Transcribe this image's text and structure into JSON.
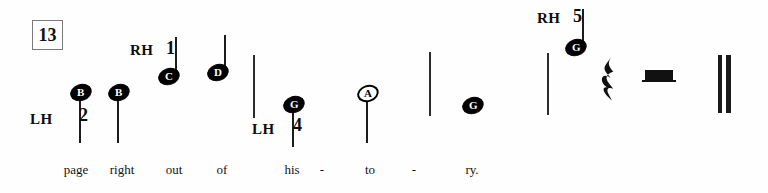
{
  "score": {
    "measure_number": "13",
    "background_color": "#fefefe",
    "ink_color": "#111111"
  },
  "hand_indications": [
    {
      "label": "LH",
      "finger": "2",
      "x": 30,
      "y": 112,
      "finger_x": 79,
      "finger_y": 106
    },
    {
      "label": "RH",
      "finger": "1",
      "x": 130,
      "y": 43,
      "finger_x": 166,
      "finger_y": 39
    },
    {
      "label": "LH",
      "finger": "4",
      "x": 252,
      "y": 122,
      "finger_x": 293,
      "finger_y": 116
    },
    {
      "label": "RH",
      "finger": "5",
      "x": 537,
      "y": 11,
      "finger_x": 573,
      "finger_y": 7
    }
  ],
  "notes": [
    {
      "letter": "B",
      "head": "filled",
      "x": 70,
      "y": 84,
      "stem": true,
      "stem_x": 79,
      "stem_top": 96,
      "stem_bottom": 143
    },
    {
      "letter": "B",
      "head": "filled",
      "x": 108,
      "y": 84,
      "stem": true,
      "stem_x": 117,
      "stem_top": 96,
      "stem_bottom": 143
    },
    {
      "letter": "C",
      "head": "filled",
      "x": 158,
      "y": 68,
      "stem": true,
      "stem_x": 175,
      "stem_top": 37,
      "stem_bottom": 80
    },
    {
      "letter": "D",
      "head": "filled",
      "x": 207,
      "y": 64,
      "stem": true,
      "stem_x": 224,
      "stem_top": 35,
      "stem_bottom": 76
    },
    {
      "letter": "G",
      "head": "filled",
      "x": 283,
      "y": 96,
      "stem": true,
      "stem_x": 292,
      "stem_top": 108,
      "stem_bottom": 147
    },
    {
      "letter": "A",
      "head": "hollow",
      "x": 357,
      "y": 85,
      "stem": true,
      "stem_x": 366,
      "stem_top": 97,
      "stem_bottom": 143
    },
    {
      "letter": "G",
      "head": "filled",
      "x": 462,
      "y": 97,
      "stem": false
    },
    {
      "letter": "G",
      "head": "filled",
      "x": 565,
      "y": 39,
      "stem": true,
      "stem_x": 582,
      "stem_top": 9,
      "stem_bottom": 52
    }
  ],
  "barlines": [
    {
      "x": 253,
      "top": 55,
      "bottom": 118
    },
    {
      "x": 429,
      "top": 52,
      "bottom": 116
    },
    {
      "x": 547,
      "top": 53,
      "bottom": 115
    }
  ],
  "final_barline": {
    "x": 718,
    "top": 55,
    "bottom": 113
  },
  "rests": [
    {
      "type": "quarter-rest",
      "x": 598,
      "y": 55,
      "width": 22,
      "height": 48
    },
    {
      "type": "half-rest",
      "x": 645,
      "y": 70,
      "width": 28,
      "height": 10
    }
  ],
  "lyrics": [
    {
      "text": "page",
      "x": 76,
      "y": 163
    },
    {
      "text": "right",
      "x": 122,
      "y": 163
    },
    {
      "text": "out",
      "x": 174,
      "y": 163
    },
    {
      "text": "of",
      "x": 222,
      "y": 163
    },
    {
      "text": "his",
      "x": 292,
      "y": 163
    },
    {
      "text": "-",
      "x": 322,
      "y": 163
    },
    {
      "text": "to",
      "x": 370,
      "y": 163
    },
    {
      "text": "-",
      "x": 414,
      "y": 163
    },
    {
      "text": "ry.",
      "x": 472,
      "y": 163
    }
  ],
  "sizes": {
    "measure_box": {
      "x": 32,
      "y": 20,
      "w": 29,
      "h": 28,
      "font": 18
    },
    "hand_font": 15,
    "finger_font": 18,
    "notehead_w": 22,
    "notehead_h": 17,
    "notehead_font": 11,
    "lyric_font": 13
  }
}
